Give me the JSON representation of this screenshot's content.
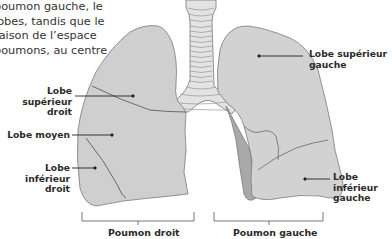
{
  "intro_text": {
    "lines": [
      "poumon gauche, le",
      "lobes, tandis que le",
      "raison de l’espace",
      "poumons, au centre"
    ]
  },
  "labels": {
    "right_upper": {
      "line1": "Lobe supérieur",
      "line2": "droit"
    },
    "right_middle": {
      "line1": "Lobe moyen"
    },
    "right_lower": {
      "line1": "Lobe inférieur",
      "line2": "droit"
    },
    "left_upper": {
      "line1": "Lobe supérieur",
      "line2": "gauche"
    },
    "left_lower": {
      "line1": "Lobe inférieur",
      "line2": "gauche"
    }
  },
  "captions": {
    "right_lung": "Poumon droit",
    "left_lung": "Poumon gauche"
  },
  "colors": {
    "lung_fill": "#cfcfcf",
    "lung_dark": "#a9a9a9",
    "outline": "#6e6e6e",
    "text": "#2a2a2a"
  }
}
